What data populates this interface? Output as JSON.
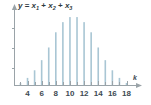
{
  "chart_data": {
    "type": "bar",
    "title": "y = x1 + x2 + x3",
    "title_parts": {
      "y": "y",
      "equals": "=",
      "x": "x",
      "sub1": "1",
      "sub2": "2",
      "sub3": "3",
      "plus": "+"
    },
    "xlabel": "k",
    "ylabel": "",
    "categories": [
      3,
      4,
      5,
      6,
      7,
      8,
      9,
      10,
      11,
      12,
      13,
      14,
      15,
      16,
      17,
      18
    ],
    "values": [
      1,
      3,
      6,
      10,
      15,
      21,
      25,
      27,
      27,
      25,
      21,
      15,
      10,
      6,
      3,
      1
    ],
    "xtick_labels": [
      "4",
      "6",
      "8",
      "10",
      "12",
      "14",
      "16",
      "18"
    ],
    "xtick_values": [
      4,
      6,
      8,
      10,
      12,
      14,
      16,
      18
    ],
    "xtick_minor_values": [
      3,
      5,
      7,
      9,
      11,
      13,
      15,
      17
    ],
    "ytick_count": 3,
    "ytick_labels": [],
    "xlim": [
      2.3,
      19.2
    ],
    "ylim": [
      0,
      29
    ],
    "grid": false,
    "legend": null,
    "bar_color": "#a9c6d4",
    "axis_color": "#9aa3a8",
    "text_color": "#3d4a52",
    "background": "#ffffff"
  }
}
